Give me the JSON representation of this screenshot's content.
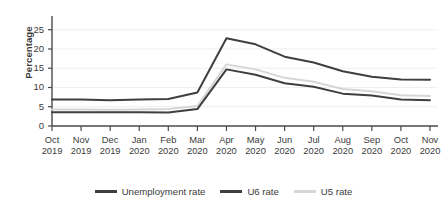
{
  "chart_data": {
    "type": "line",
    "title": "",
    "xlabel": "",
    "ylabel": "Percentage",
    "ylim": [
      0,
      27
    ],
    "yticks": [
      0,
      5,
      10,
      15,
      20,
      25
    ],
    "grid": true,
    "legend_position": "bottom",
    "categories": [
      "Oct 2019",
      "Nov 2019",
      "Dec 2019",
      "Jan 2020",
      "Feb 2020",
      "Mar 2020",
      "Apr 2020",
      "May 2020",
      "Jun 2020",
      "Jul 2020",
      "Aug 2020",
      "Sep 2020",
      "Oct 2020",
      "Nov 2020"
    ],
    "x_tick_months": [
      "Oct",
      "Nov",
      "Dec",
      "Jan",
      "Feb",
      "Mar",
      "Apr",
      "May",
      "Jun",
      "Jul",
      "Aug",
      "Sep",
      "Oct",
      "Nov"
    ],
    "x_tick_years": [
      "2019",
      "2019",
      "2019",
      "2020",
      "2020",
      "2020",
      "2020",
      "2020",
      "2020",
      "2020",
      "2020",
      "2020",
      "2020",
      "2020"
    ],
    "series": [
      {
        "name": "Unemployment rate",
        "color": "#3f3f3f",
        "width": 2.0,
        "values": [
          3.6,
          3.6,
          3.6,
          3.6,
          3.5,
          4.4,
          14.7,
          13.3,
          11.1,
          10.2,
          8.4,
          7.9,
          6.9,
          6.7
        ]
      },
      {
        "name": "U6 rate",
        "color": "#3f3f3f",
        "width": 2.0,
        "values": [
          6.9,
          6.9,
          6.7,
          6.9,
          7.0,
          8.7,
          22.8,
          21.2,
          18.0,
          16.5,
          14.2,
          12.8,
          12.1,
          12.0
        ]
      },
      {
        "name": "U5 rate",
        "color": "#d6d6d6",
        "width": 2.0,
        "values": [
          4.3,
          4.3,
          4.2,
          4.3,
          4.4,
          5.2,
          16.0,
          14.7,
          12.5,
          11.5,
          9.6,
          9.0,
          8.0,
          7.8
        ]
      }
    ]
  },
  "legend": {
    "items": [
      {
        "label": "Unemployment rate",
        "color": "#3f3f3f"
      },
      {
        "label": "U6 rate",
        "color": "#3f3f3f"
      },
      {
        "label": "U5 rate",
        "color": "#d6d6d6"
      }
    ]
  },
  "axes": {
    "y_title": "Percentage",
    "axis_color": "#4a4a4a",
    "grid_color": "#efefef"
  }
}
